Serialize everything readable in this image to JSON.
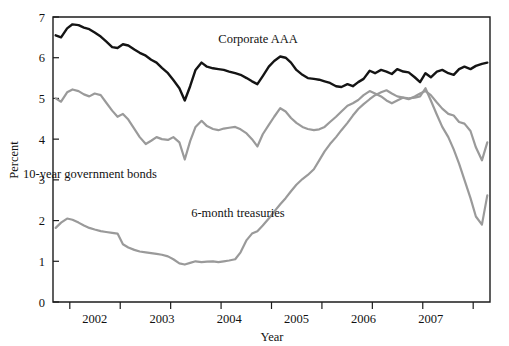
{
  "chart_data": {
    "type": "line",
    "title": "",
    "xlabel": "Year",
    "ylabel": "Percent",
    "ylim": [
      0,
      7
    ],
    "yticks": [
      0,
      1,
      2,
      3,
      4,
      5,
      6,
      7
    ],
    "ytick_labels": [
      "0",
      "1",
      "2",
      "3",
      "4",
      "5",
      "6",
      "7"
    ],
    "xlim": [
      2001.5,
      2008.0
    ],
    "xticks": [
      2002,
      2003,
      2004,
      2005,
      2006,
      2007
    ],
    "xtick_labels": [
      "2002",
      "2003",
      "2004",
      "2005",
      "2006",
      "2007"
    ],
    "grid": false,
    "legend": "inline-annotations",
    "colors": {
      "corporate_aaa": "#141414",
      "ten_year_bonds": "#9a9a9a",
      "six_month_treasuries": "#9a9a9a",
      "axis": "#1c1c1c",
      "background": "#ffffff"
    },
    "x": [
      2001.54,
      2001.62,
      2001.71,
      2001.79,
      2001.88,
      2001.96,
      2002.04,
      2002.12,
      2002.21,
      2002.29,
      2002.38,
      2002.46,
      2002.54,
      2002.62,
      2002.71,
      2002.79,
      2002.88,
      2002.96,
      2003.04,
      2003.12,
      2003.21,
      2003.29,
      2003.38,
      2003.46,
      2003.54,
      2003.62,
      2003.71,
      2003.79,
      2003.88,
      2003.96,
      2004.04,
      2004.12,
      2004.21,
      2004.29,
      2004.38,
      2004.46,
      2004.54,
      2004.62,
      2004.71,
      2004.79,
      2004.88,
      2004.96,
      2005.04,
      2005.12,
      2005.21,
      2005.29,
      2005.38,
      2005.46,
      2005.54,
      2005.62,
      2005.71,
      2005.79,
      2005.88,
      2005.96,
      2006.04,
      2006.12,
      2006.21,
      2006.29,
      2006.38,
      2006.46,
      2006.54,
      2006.62,
      2006.71,
      2006.79,
      2006.88,
      2006.96,
      2007.04,
      2007.12,
      2007.21,
      2007.29,
      2007.38,
      2007.46,
      2007.54,
      2007.62,
      2007.71,
      2007.79,
      2007.88,
      2007.96
    ],
    "series": [
      {
        "name": "Corporate AAA",
        "color": "#141414",
        "label_x": 2004.55,
        "label_y": 6.35,
        "values": [
          6.55,
          6.5,
          6.72,
          6.82,
          6.8,
          6.74,
          6.7,
          6.62,
          6.52,
          6.4,
          6.26,
          6.24,
          6.33,
          6.3,
          6.2,
          6.12,
          6.05,
          5.95,
          5.88,
          5.75,
          5.62,
          5.45,
          5.25,
          4.95,
          5.3,
          5.7,
          5.88,
          5.78,
          5.74,
          5.72,
          5.7,
          5.66,
          5.62,
          5.58,
          5.5,
          5.42,
          5.35,
          5.55,
          5.78,
          5.92,
          6.03,
          6.0,
          5.88,
          5.7,
          5.58,
          5.5,
          5.48,
          5.46,
          5.42,
          5.38,
          5.3,
          5.28,
          5.35,
          5.3,
          5.4,
          5.48,
          5.68,
          5.62,
          5.7,
          5.66,
          5.6,
          5.72,
          5.66,
          5.64,
          5.52,
          5.4,
          5.62,
          5.52,
          5.66,
          5.7,
          5.62,
          5.58,
          5.72,
          5.78,
          5.72,
          5.8,
          5.85,
          5.88
        ]
      },
      {
        "name": "10-year government bonds",
        "color": "#9a9a9a",
        "label_x": 2002.05,
        "label_y": 3.05,
        "values": [
          5.0,
          4.92,
          5.15,
          5.22,
          5.18,
          5.1,
          5.05,
          5.12,
          5.08,
          4.9,
          4.7,
          4.55,
          4.62,
          4.48,
          4.25,
          4.05,
          3.88,
          3.96,
          4.05,
          4.0,
          3.98,
          4.05,
          3.92,
          3.5,
          3.95,
          4.3,
          4.45,
          4.32,
          4.25,
          4.22,
          4.26,
          4.28,
          4.3,
          4.24,
          4.14,
          4.0,
          3.82,
          4.12,
          4.35,
          4.55,
          4.76,
          4.68,
          4.52,
          4.4,
          4.3,
          4.25,
          4.22,
          4.24,
          4.3,
          4.42,
          4.55,
          4.68,
          4.82,
          4.88,
          4.96,
          5.08,
          5.18,
          5.12,
          5.05,
          4.95,
          4.88,
          4.95,
          5.02,
          4.98,
          5.05,
          5.12,
          5.18,
          5.08,
          4.9,
          4.75,
          4.62,
          4.58,
          4.42,
          4.38,
          4.2,
          3.8,
          3.48,
          3.92
        ]
      },
      {
        "name": "6-month treasuries",
        "color": "#9a9a9a",
        "label_x": 2004.25,
        "label_y": 2.08,
        "values": [
          1.82,
          1.95,
          2.05,
          2.02,
          1.95,
          1.88,
          1.82,
          1.78,
          1.74,
          1.72,
          1.7,
          1.68,
          1.42,
          1.34,
          1.28,
          1.24,
          1.22,
          1.2,
          1.18,
          1.16,
          1.12,
          1.05,
          0.95,
          0.92,
          0.96,
          1.0,
          0.98,
          0.99,
          1.0,
          0.98,
          1.0,
          1.02,
          1.05,
          1.22,
          1.52,
          1.68,
          1.74,
          1.88,
          2.05,
          2.22,
          2.4,
          2.55,
          2.72,
          2.88,
          3.02,
          3.12,
          3.26,
          3.48,
          3.7,
          3.88,
          4.05,
          4.22,
          4.4,
          4.58,
          4.74,
          4.86,
          4.98,
          5.08,
          5.15,
          5.2,
          5.12,
          5.05,
          5.02,
          5.0,
          5.02,
          5.05,
          5.25,
          4.95,
          4.6,
          4.3,
          4.05,
          3.75,
          3.4,
          3.0,
          2.55,
          2.1,
          1.9,
          2.62
        ]
      }
    ]
  },
  "annotations": {
    "corporate_aaa": "Corporate AAA",
    "ten_year": "10-year government bonds",
    "six_month": "6-month treasuries"
  },
  "axes": {
    "x_title": "Year",
    "y_title": "Percent"
  }
}
